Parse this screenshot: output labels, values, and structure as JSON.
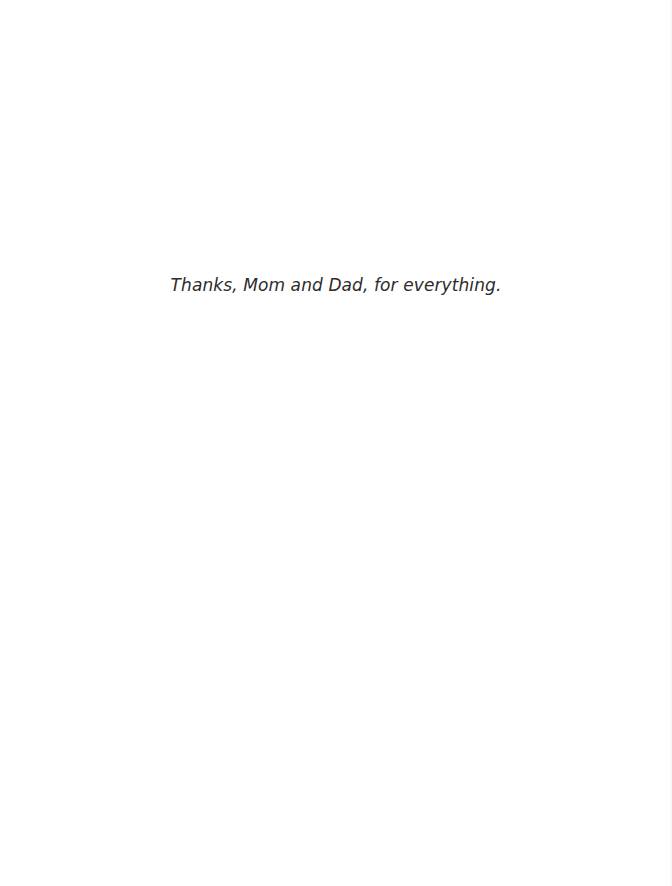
{
  "page": {
    "dedication": "Thanks, Mom and Dad, for everything."
  },
  "colors": {
    "background": "#ffffff",
    "text": "#2b2b2b"
  }
}
